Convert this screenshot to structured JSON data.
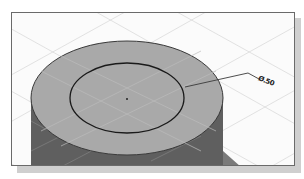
{
  "figure": {
    "dimension_label": "Ø.50",
    "colors": {
      "background": "#fbfbfb",
      "grid": "#d8d8d8",
      "top_face": "#a9a9a9",
      "side_face": "#5f5f5f",
      "sketch_line": "#1a1a1a",
      "frame_border": "#6a6a6a",
      "shadow": "#cfcfcf"
    }
  }
}
